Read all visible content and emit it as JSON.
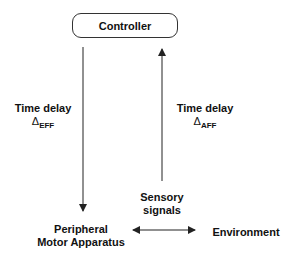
{
  "diagram": {
    "controller": {
      "label": "Controller"
    },
    "efferent": {
      "label": "Time delay",
      "delta_symbol": "Δ",
      "subscript": "EFF"
    },
    "afferent": {
      "label": "Time delay",
      "delta_symbol": "Δ",
      "subscript": "AFF"
    },
    "sensory": {
      "line1": "Sensory",
      "line2": "signals"
    },
    "peripheral": {
      "line1": "Peripheral",
      "line2": "Motor Apparatus"
    },
    "environment": {
      "label": "Environment"
    },
    "colors": {
      "stroke": "#222222",
      "text": "#111111",
      "background": "#ffffff"
    }
  }
}
